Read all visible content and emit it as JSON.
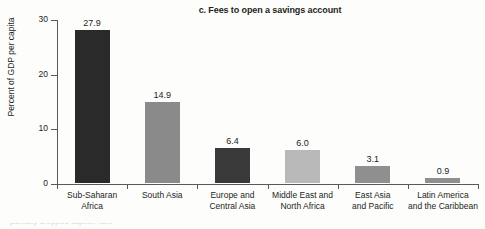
{
  "chart_data": {
    "type": "bar",
    "title": "c. Fees to open a savings account",
    "xlabel": "",
    "ylabel": "Percent of GDP per capita",
    "ylim": [
      0,
      30
    ],
    "yticks": [
      0,
      10,
      20,
      30
    ],
    "grid": false,
    "legend": null,
    "categories": [
      "Sub-Saharan Africa",
      "South Asia",
      "Europe and Central Asia",
      "Middle East and North Africa",
      "East Asia and Pacific",
      "Latin America and the Caribbean"
    ],
    "category_lines": [
      [
        "Sub-Saharan",
        "Africa"
      ],
      [
        "South Asia"
      ],
      [
        "Europe and",
        "Central Asia"
      ],
      [
        "Middle East and",
        "North Africa"
      ],
      [
        "East Asia",
        "and Pacific"
      ],
      [
        "Latin America",
        "and the Caribbean"
      ]
    ],
    "values": [
      27.9,
      14.9,
      6.4,
      6.0,
      3.1,
      0.9
    ],
    "value_labels": [
      "27.9",
      "14.9",
      "6.4",
      "6.0",
      "3.1",
      "0.9"
    ],
    "bar_colors": [
      "#2a2a2a",
      "#8a8a8a",
      "#3a3a3a",
      "#b9b9b9",
      "#8f8f8f",
      "#8f8f8f"
    ]
  },
  "axis": {
    "tick_labels": [
      "0",
      "10",
      "20",
      "30"
    ],
    "line_color": "#58595b"
  },
  "caption": {
    "cropped_text": "partially cropped caption text"
  }
}
